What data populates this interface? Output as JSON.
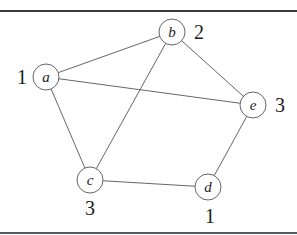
{
  "diagram": {
    "type": "graph-coloring",
    "nodes": [
      {
        "id": "a",
        "label": "a",
        "x": 46,
        "y": 77,
        "color_number": "1",
        "num_x": 22,
        "num_y": 84
      },
      {
        "id": "b",
        "label": "b",
        "x": 172,
        "y": 32,
        "color_number": "2",
        "num_x": 199,
        "num_y": 39
      },
      {
        "id": "c",
        "label": "c",
        "x": 90,
        "y": 180,
        "color_number": "3",
        "num_x": 90,
        "num_y": 215
      },
      {
        "id": "d",
        "label": "d",
        "x": 208,
        "y": 187,
        "color_number": "1",
        "num_x": 210,
        "num_y": 223
      },
      {
        "id": "e",
        "label": "e",
        "x": 253,
        "y": 105,
        "color_number": "3",
        "num_x": 280,
        "num_y": 112
      }
    ],
    "edges": [
      {
        "from": "a",
        "to": "b"
      },
      {
        "from": "a",
        "to": "e"
      },
      {
        "from": "a",
        "to": "c"
      },
      {
        "from": "b",
        "to": "c"
      },
      {
        "from": "b",
        "to": "e"
      },
      {
        "from": "e",
        "to": "d"
      },
      {
        "from": "c",
        "to": "d"
      }
    ],
    "node_radius": 13
  }
}
